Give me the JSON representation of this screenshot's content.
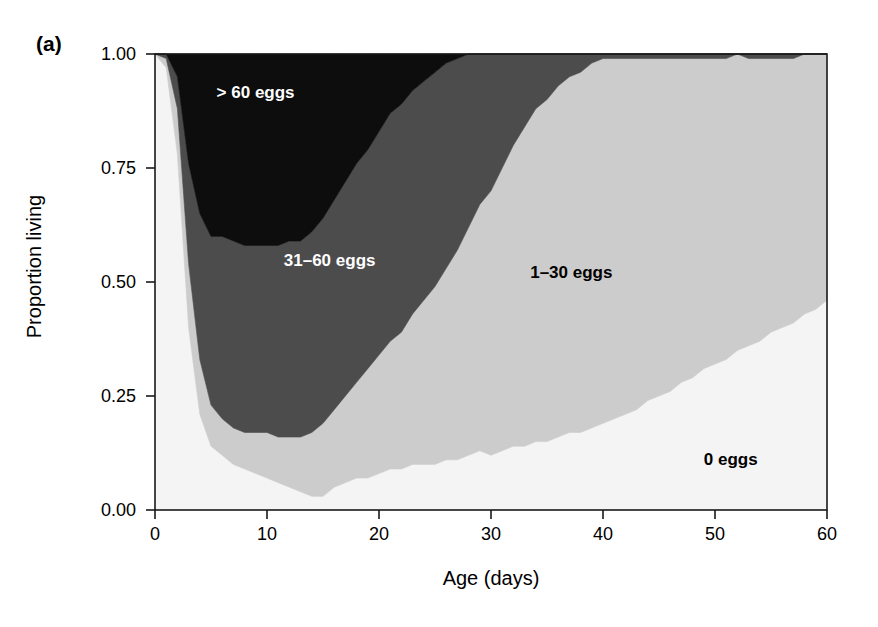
{
  "figure": {
    "panel_label": "(a)",
    "background": "#ffffff"
  },
  "axes": {
    "x": {
      "label": "Age (days)",
      "ticks": [
        "0",
        "10",
        "20",
        "30",
        "40",
        "50",
        "60"
      ],
      "tick_values": [
        0,
        10,
        20,
        30,
        40,
        50,
        60
      ],
      "range": [
        0,
        60
      ]
    },
    "y": {
      "label": "Proportion living",
      "ticks": [
        "0.00",
        "0.25",
        "0.50",
        "0.75",
        "1.00"
      ],
      "tick_values": [
        0.0,
        0.25,
        0.5,
        0.75,
        1.0
      ],
      "range": [
        0,
        1
      ]
    }
  },
  "band_labels": [
    {
      "text": "> 60 eggs",
      "x_day": 5.5,
      "y_prop": 0.915,
      "color": "light"
    },
    {
      "text": "31–60 eggs",
      "x_day": 11.5,
      "y_prop": 0.545,
      "color": "light"
    },
    {
      "text": "1–30 eggs",
      "x_day": 33.5,
      "y_prop": 0.52,
      "color": "dark"
    },
    {
      "text": "0 eggs",
      "x_day": 49.0,
      "y_prop": 0.11,
      "color": "dark"
    }
  ],
  "colors": {
    "zero_eggs": "#f4f4f4",
    "one_to_thirty_eggs": "#cccccc",
    "thirtyone_to_sixty_eggs": "#4c4c4c",
    "over_sixty_eggs": "#0d0d0d",
    "axis": "#1a1a1a",
    "frame": "#1a1a1a"
  },
  "chart_data": {
    "type": "area",
    "stacked": true,
    "normalized": true,
    "title": "",
    "xlabel": "Age (days)",
    "ylabel": "Proportion living",
    "xlim": [
      0,
      60
    ],
    "ylim": [
      0,
      1
    ],
    "grid": false,
    "legend_position": "inline-band-labels",
    "x": [
      0,
      1,
      2,
      3,
      4,
      5,
      6,
      7,
      8,
      9,
      10,
      11,
      12,
      13,
      14,
      15,
      16,
      17,
      18,
      19,
      20,
      21,
      22,
      23,
      24,
      25,
      26,
      27,
      28,
      29,
      30,
      31,
      32,
      33,
      34,
      35,
      36,
      37,
      38,
      39,
      40,
      41,
      42,
      43,
      44,
      45,
      46,
      47,
      48,
      49,
      50,
      51,
      52,
      53,
      54,
      55,
      56,
      57,
      58,
      59,
      60
    ],
    "series": [
      {
        "name": "0 eggs",
        "fill": "#f4f4f4",
        "values": [
          1.0,
          0.97,
          0.78,
          0.4,
          0.21,
          0.14,
          0.12,
          0.1,
          0.09,
          0.08,
          0.07,
          0.06,
          0.05,
          0.04,
          0.03,
          0.03,
          0.05,
          0.06,
          0.07,
          0.07,
          0.08,
          0.09,
          0.09,
          0.1,
          0.1,
          0.1,
          0.11,
          0.11,
          0.12,
          0.13,
          0.12,
          0.13,
          0.14,
          0.14,
          0.15,
          0.15,
          0.16,
          0.17,
          0.17,
          0.18,
          0.19,
          0.2,
          0.21,
          0.22,
          0.24,
          0.25,
          0.26,
          0.28,
          0.29,
          0.31,
          0.32,
          0.33,
          0.35,
          0.36,
          0.37,
          0.39,
          0.4,
          0.41,
          0.43,
          0.44,
          0.46
        ]
      },
      {
        "name": "1–30 eggs",
        "fill": "#cccccc",
        "values": [
          0.0,
          0.02,
          0.1,
          0.14,
          0.12,
          0.09,
          0.08,
          0.08,
          0.08,
          0.09,
          0.1,
          0.1,
          0.11,
          0.12,
          0.14,
          0.16,
          0.17,
          0.19,
          0.21,
          0.24,
          0.26,
          0.28,
          0.3,
          0.33,
          0.36,
          0.39,
          0.42,
          0.46,
          0.5,
          0.54,
          0.58,
          0.62,
          0.66,
          0.7,
          0.73,
          0.75,
          0.77,
          0.78,
          0.79,
          0.8,
          0.8,
          0.79,
          0.78,
          0.77,
          0.75,
          0.74,
          0.73,
          0.71,
          0.7,
          0.68,
          0.67,
          0.66,
          0.65,
          0.63,
          0.62,
          0.6,
          0.59,
          0.58,
          0.57,
          0.56,
          0.54
        ]
      },
      {
        "name": "31–60 eggs",
        "fill": "#4c4c4c",
        "values": [
          0.0,
          0.01,
          0.07,
          0.22,
          0.32,
          0.37,
          0.4,
          0.41,
          0.41,
          0.41,
          0.41,
          0.42,
          0.43,
          0.43,
          0.44,
          0.45,
          0.46,
          0.47,
          0.48,
          0.48,
          0.49,
          0.5,
          0.5,
          0.49,
          0.48,
          0.47,
          0.45,
          0.42,
          0.38,
          0.33,
          0.3,
          0.25,
          0.2,
          0.16,
          0.12,
          0.1,
          0.07,
          0.05,
          0.04,
          0.02,
          0.01,
          0.01,
          0.01,
          0.01,
          0.01,
          0.01,
          0.01,
          0.01,
          0.01,
          0.01,
          0.01,
          0.01,
          0.0,
          0.01,
          0.01,
          0.01,
          0.01,
          0.01,
          0.0,
          0.0,
          0.0
        ]
      },
      {
        "name": "> 60 eggs",
        "fill": "#0d0d0d",
        "values": [
          0.0,
          0.0,
          0.05,
          0.24,
          0.35,
          0.4,
          0.4,
          0.41,
          0.42,
          0.42,
          0.42,
          0.42,
          0.41,
          0.41,
          0.39,
          0.36,
          0.32,
          0.28,
          0.24,
          0.21,
          0.17,
          0.13,
          0.11,
          0.08,
          0.06,
          0.04,
          0.02,
          0.01,
          0.0,
          0.0,
          0.0,
          0.0,
          0.0,
          0.0,
          0.0,
          0.0,
          0.0,
          0.0,
          0.0,
          0.0,
          0.0,
          0.0,
          0.0,
          0.0,
          0.0,
          0.0,
          0.0,
          0.0,
          0.0,
          0.0,
          0.0,
          0.0,
          0.0,
          0.0,
          0.0,
          0.0,
          0.0,
          0.0,
          0.0,
          0.0,
          0.0
        ]
      }
    ]
  }
}
